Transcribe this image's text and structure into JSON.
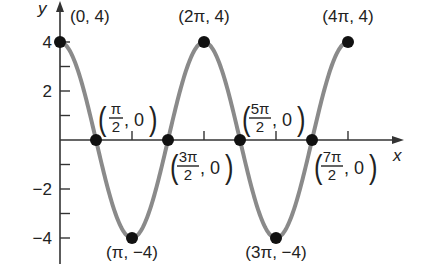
{
  "chart_data": {
    "type": "line",
    "title": "",
    "function": "y = 4 cos x",
    "xlabel": "x",
    "ylabel": "y",
    "xlim": [
      0,
      12.566
    ],
    "ylim": [
      -4,
      4
    ],
    "grid": false,
    "legend": null,
    "y_ticks": [
      {
        "value": 4,
        "label": "4"
      },
      {
        "value": 3,
        "label": ""
      },
      {
        "value": 2,
        "label": "2"
      },
      {
        "value": 1,
        "label": ""
      },
      {
        "value": -1,
        "label": ""
      },
      {
        "value": -2,
        "label": "−2"
      },
      {
        "value": -3,
        "label": ""
      },
      {
        "value": -4,
        "label": "−4"
      }
    ],
    "x_ticks": [
      {
        "value": 3.1416,
        "label": ""
      },
      {
        "value": 6.2832,
        "label": ""
      },
      {
        "value": 9.4248,
        "label": ""
      },
      {
        "value": 12.566,
        "label": ""
      }
    ],
    "series": [
      {
        "name": "4cos(x)",
        "color": "#8a8a8a",
        "x_start": 0,
        "x_end": 12.566,
        "amplitude": 4,
        "period": 6.2832
      }
    ],
    "points": [
      {
        "x": 0,
        "y": 4,
        "label": "(0, 4)"
      },
      {
        "x": 1.5708,
        "y": 0,
        "label_num": "π",
        "label_den": "2",
        "label_y": "0"
      },
      {
        "x": 3.1416,
        "y": -4,
        "label": "(π, −4)"
      },
      {
        "x": 4.7124,
        "y": 0,
        "label_num": "3π",
        "label_den": "2",
        "label_y": "0"
      },
      {
        "x": 6.2832,
        "y": 4,
        "label": "(2π, 4)"
      },
      {
        "x": 7.854,
        "y": 0,
        "label_num": "5π",
        "label_den": "2",
        "label_y": "0"
      },
      {
        "x": 9.4248,
        "y": -4,
        "label": "(3π, −4)"
      },
      {
        "x": 10.9956,
        "y": 0,
        "label_num": "7π",
        "label_den": "2",
        "label_y": "0"
      },
      {
        "x": 12.566,
        "y": 4,
        "label": "(4π, 4)"
      }
    ],
    "colors": {
      "curve": "#8a8a8a",
      "axis": "#333333",
      "point": "#111111",
      "text": "#222222"
    }
  }
}
